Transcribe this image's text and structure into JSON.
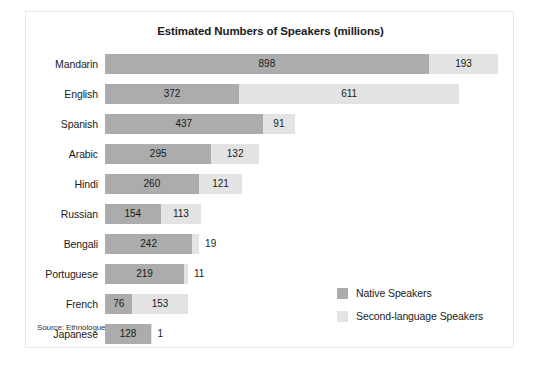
{
  "figure": {
    "title": "Estimated Numbers of Speakers (millions)",
    "source_note": "Source: Ethnologue",
    "border_color": "#e8e8e8",
    "background": "#ffffff"
  },
  "legend": {
    "position": "bottom-right",
    "items": [
      {
        "label": "Native Speakers",
        "color": "#acacac",
        "name": "native-speakers"
      },
      {
        "label": "Second-language Speakers",
        "color": "#e3e3e3",
        "name": "second-language-speakers"
      }
    ]
  },
  "chart_data": {
    "type": "bar",
    "orientation": "horizontal",
    "stacked": true,
    "title": "Estimated Numbers of Speakers (millions)",
    "xlabel": "",
    "ylabel": "",
    "xlim": [
      0,
      1100
    ],
    "grid": false,
    "axis_visible": false,
    "tick_labels_visible": false,
    "legend_position": "bottom-right",
    "units": "millions",
    "categories": [
      "Mandarin",
      "English",
      "Spanish",
      "Arabic",
      "Hindi",
      "Russian",
      "Bengali",
      "Portuguese",
      "French",
      "Japanese"
    ],
    "series": [
      {
        "name": "Native Speakers",
        "color": "#acacac",
        "values": [
          898,
          372,
          437,
          295,
          260,
          154,
          242,
          219,
          76,
          128
        ]
      },
      {
        "name": "Second-language Speakers",
        "color": "#e3e3e3",
        "values": [
          193,
          611,
          91,
          132,
          121,
          113,
          19,
          11,
          153,
          1
        ]
      }
    ],
    "totals": [
      1091,
      983,
      528,
      427,
      381,
      267,
      261,
      230,
      229,
      129
    ],
    "data_labels": [
      {
        "category": "Mandarin",
        "native": "898",
        "second": "193",
        "second_label_inside": true
      },
      {
        "category": "English",
        "native": "372",
        "second": "611",
        "second_label_inside": true
      },
      {
        "category": "Spanish",
        "native": "437",
        "second": "91",
        "second_label_inside": true
      },
      {
        "category": "Arabic",
        "native": "295",
        "second": "132",
        "second_label_inside": true
      },
      {
        "category": "Hindi",
        "native": "260",
        "second": "121",
        "second_label_inside": true
      },
      {
        "category": "Russian",
        "native": "154",
        "second": "113",
        "second_label_inside": true
      },
      {
        "category": "Bengali",
        "native": "242",
        "second": "19",
        "second_label_inside": false
      },
      {
        "category": "Portuguese",
        "native": "219",
        "second": "11",
        "second_label_inside": false
      },
      {
        "category": "French",
        "native": "76",
        "second": "153",
        "second_label_inside": true
      },
      {
        "category": "Japanese",
        "native": "128",
        "second": "1",
        "second_label_inside": false
      }
    ]
  }
}
